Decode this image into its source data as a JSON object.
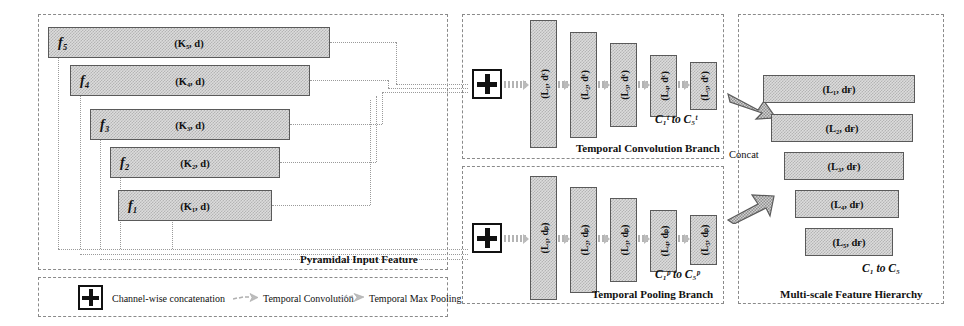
{
  "figure": {
    "panels": {
      "input": {
        "title": "Pyramidal Input Feature"
      },
      "conv": {
        "title": "Temporal Convolution Branch",
        "output_label": "C₁ᵗ to C₅ᵗ"
      },
      "pool": {
        "title": "Temporal Pooling Branch",
        "output_label": "C₁ᵖ to C₅ᵖ"
      },
      "hier": {
        "title": "Multi-scale Feature Hierarchy",
        "output_label": "C₁ to C₅",
        "concat_label": "Concat"
      }
    },
    "pyramid_boxes": [
      {
        "name": "f₅",
        "dims": "(K₅, d)"
      },
      {
        "name": "f₄",
        "dims": "(K₄, d)"
      },
      {
        "name": "f₃",
        "dims": "(K₃, d)"
      },
      {
        "name": "f₂",
        "dims": "(K₂, d)"
      },
      {
        "name": "f₁",
        "dims": "(K₁, d)"
      }
    ],
    "conv_boxes": [
      {
        "label": "(L₁, dᶜ)"
      },
      {
        "label": "(L₂, dᶜ)"
      },
      {
        "label": "(L₃, dᶜ)"
      },
      {
        "label": "(L₄, dᶜ)"
      },
      {
        "label": "(L₅, dᶜ)"
      }
    ],
    "pool_boxes": [
      {
        "label": "(L₁, dₚ)"
      },
      {
        "label": "(L₂, dₚ)"
      },
      {
        "label": "(L₃, dₚ)"
      },
      {
        "label": "(L₄, dₚ)"
      },
      {
        "label": "(L₅, dₚ)"
      }
    ],
    "hierarchy_boxes": [
      {
        "label": "(L₁, dғ)"
      },
      {
        "label": "(L₂, dғ)"
      },
      {
        "label": "(L₃, dғ)"
      },
      {
        "label": "(L₄, dғ)"
      },
      {
        "label": "(L₅, dғ)"
      }
    ],
    "concat_symbol": "+",
    "legend": [
      {
        "icon": "plus-in-box-icon",
        "text": "Channel-wise concatenation"
      },
      {
        "icon": "dotted-arrow-icon",
        "text": "Temporal Convolution"
      },
      {
        "icon": "wavy-dotted-arrow-icon",
        "text": "Temporal Max Pooling"
      }
    ],
    "colors": {
      "box_fill": "#dcdcdc",
      "box_hatch": "#b4b4b4",
      "box_border": "#5a5a5a",
      "panel_border": "#8a8a8a",
      "connector": "#9a9a9a",
      "text": "#111111"
    }
  }
}
